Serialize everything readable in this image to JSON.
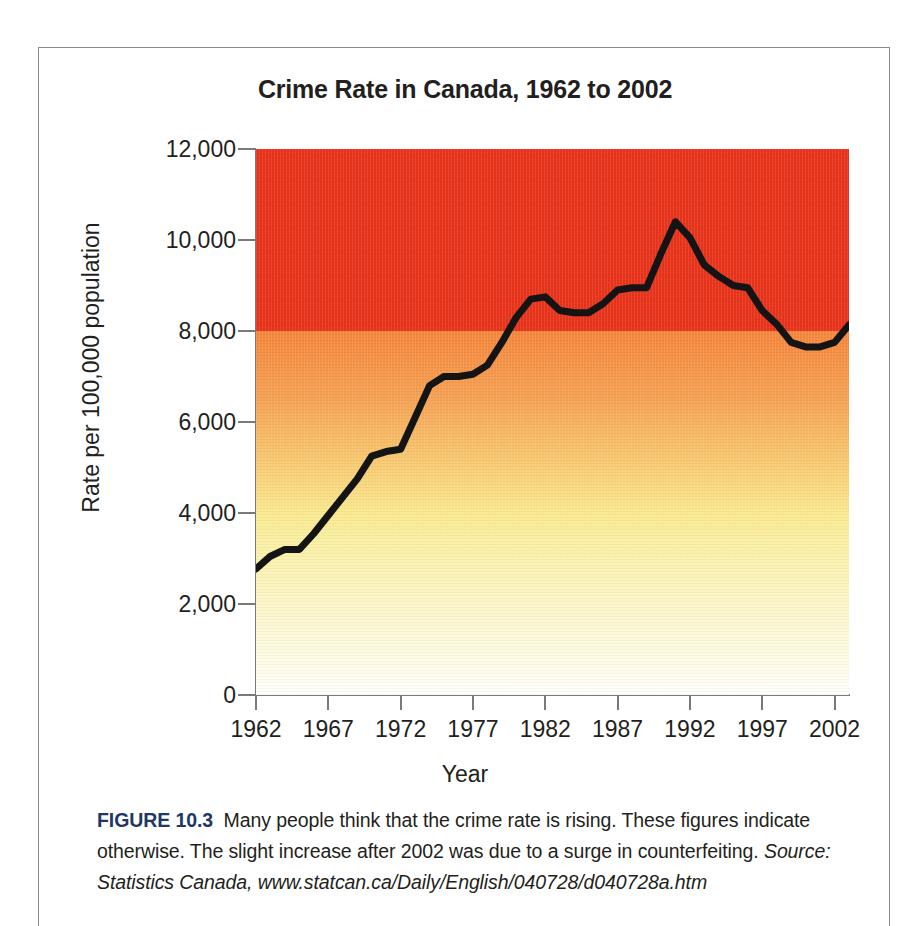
{
  "figure": {
    "caption_label": "FIGURE 10.3",
    "caption_text": "Many people think that the crime rate is rising. These figures indicate otherwise. The slight increase after 2002 was due to a surge in counterfeiting.",
    "caption_source": "Source: Statistics Canada, www.statcan.ca/Daily/English/040728/d040728a.htm"
  },
  "chart_data": {
    "type": "line",
    "title": "Crime Rate in Canada, 1962 to 2002",
    "xlabel": "Year",
    "ylabel": "Rate per 100,000 population",
    "xlim": [
      1962,
      2003
    ],
    "ylim": [
      0,
      12000
    ],
    "grid": false,
    "legend": null,
    "y_ticks": [
      0,
      2000,
      4000,
      6000,
      8000,
      10000,
      12000
    ],
    "y_tick_labels": [
      "0",
      "2,000",
      "4,000",
      "6,000",
      "8,000",
      "10,000",
      "12,000"
    ],
    "x_ticks": [
      1962,
      1967,
      1972,
      1977,
      1982,
      1987,
      1992,
      1997,
      2002
    ],
    "x_tick_labels": [
      "1962",
      "1967",
      "1972",
      "1977",
      "1982",
      "1987",
      "1992",
      "1997",
      "2002"
    ],
    "line_color": "#141414",
    "background_bands": [
      {
        "from": 8000,
        "to": 12000,
        "color": "#E8331A"
      },
      {
        "from": 4000,
        "to": 8000,
        "color": "#F5863B"
      },
      {
        "from": 0,
        "to": 4000,
        "color": "#FBF0A4"
      }
    ],
    "x": [
      1962,
      1963,
      1964,
      1965,
      1966,
      1967,
      1968,
      1969,
      1970,
      1971,
      1972,
      1973,
      1974,
      1975,
      1976,
      1977,
      1978,
      1979,
      1980,
      1981,
      1982,
      1983,
      1984,
      1985,
      1986,
      1987,
      1988,
      1989,
      1990,
      1991,
      1992,
      1993,
      1994,
      1995,
      1996,
      1997,
      1998,
      1999,
      2000,
      2001,
      2002,
      2003
    ],
    "y": [
      2771,
      3050,
      3200,
      3200,
      3550,
      3950,
      4350,
      4750,
      5250,
      5350,
      5400,
      6100,
      6800,
      7000,
      7000,
      7050,
      7250,
      7750,
      8300,
      8700,
      8750,
      8450,
      8400,
      8400,
      8600,
      8900,
      8950,
      8950,
      9700,
      10400,
      10050,
      9450,
      9200,
      9000,
      8950,
      8450,
      8150,
      7750,
      7650,
      7650,
      7750,
      8130
    ],
    "annotations": []
  }
}
